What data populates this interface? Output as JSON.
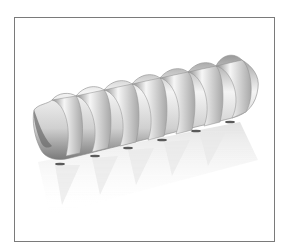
{
  "image": {
    "subject": "fusilli-pasta-3d-render",
    "description": "Spiral pasta shape rendered in grayscale with a faded reflection below",
    "colors": {
      "frame_border": "#7a7a7a",
      "background": "#ffffff",
      "pasta_light": "#f2f2f2",
      "pasta_mid": "#c4c4c4",
      "pasta_dark": "#6e6e6e",
      "reflection": "#e6e6e6"
    }
  }
}
